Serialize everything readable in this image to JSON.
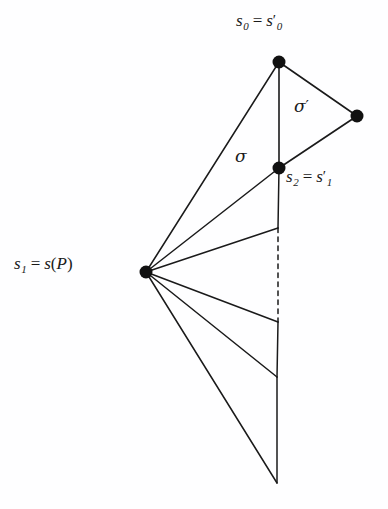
{
  "figure": {
    "name": "simplicial-fan-diagram",
    "background_color": "#fefeff",
    "stroke_color": "#1a1a1a",
    "width": 388,
    "height": 509
  },
  "labels": {
    "s0": {
      "base": "s",
      "sub": "0",
      "eq": "=",
      "base2": "s",
      "sub2": "0",
      "prime": "′",
      "text": "s0 = s0′"
    },
    "s1": {
      "base": "s",
      "sub": "1",
      "eq": "=",
      "fn": "s",
      "open": "(",
      "arg": "P",
      "close": ")",
      "text": "s1 = s(P)"
    },
    "s2": {
      "base": "s",
      "sub": "2",
      "eq": "=",
      "base2": "s",
      "sub2": "1",
      "prime": "′",
      "text": "s2 = s1′"
    },
    "sigma": {
      "glyph": "σ",
      "text": "σ"
    },
    "sigma_prime": {
      "glyph": "σ",
      "prime": "′",
      "text": "σ′"
    }
  },
  "vertices": [
    {
      "name": "s0",
      "x": 279,
      "y": 62,
      "radius": 6.5,
      "filled": true
    },
    {
      "name": "s0-prime-right",
      "x": 357,
      "y": 116,
      "radius": 6.5,
      "filled": true
    },
    {
      "name": "s2",
      "x": 279,
      "y": 168,
      "radius": 6.5,
      "filled": true
    },
    {
      "name": "s1",
      "x": 146,
      "y": 272,
      "radius": 6.5,
      "filled": true
    }
  ],
  "edges": [
    {
      "name": "edge-s0-to-right",
      "x1": 279,
      "y1": 62,
      "x2": 357,
      "y2": 116,
      "style": "solid"
    },
    {
      "name": "edge-right-to-s2",
      "x1": 357,
      "y1": 116,
      "x2": 279,
      "y2": 168,
      "style": "solid"
    },
    {
      "name": "edge-s0-to-s2-vertical",
      "x1": 279,
      "y1": 62,
      "x2": 279,
      "y2": 168,
      "style": "solid"
    },
    {
      "name": "edge-s2-to-midpoint-vertical",
      "x1": 279,
      "y1": 168,
      "x2": 278,
      "y2": 228,
      "style": "solid"
    },
    {
      "name": "edge-dashed-vertical",
      "x1": 278,
      "y1": 228,
      "x2": 278,
      "y2": 322,
      "style": "dashed"
    },
    {
      "name": "edge-lower-vertical-1",
      "x1": 278,
      "y1": 322,
      "x2": 277,
      "y2": 377,
      "style": "solid"
    },
    {
      "name": "edge-lower-vertical-2",
      "x1": 277,
      "y1": 377,
      "x2": 277,
      "y2": 483,
      "style": "solid"
    },
    {
      "name": "fan-edge-s1-to-s0",
      "x1": 146,
      "y1": 272,
      "x2": 279,
      "y2": 62,
      "style": "solid"
    },
    {
      "name": "fan-edge-s1-to-s2",
      "x1": 146,
      "y1": 272,
      "x2": 279,
      "y2": 168,
      "style": "solid"
    },
    {
      "name": "fan-edge-s1-to-p3",
      "x1": 146,
      "y1": 272,
      "x2": 278,
      "y2": 228,
      "style": "solid"
    },
    {
      "name": "fan-edge-s1-to-p4",
      "x1": 146,
      "y1": 272,
      "x2": 278,
      "y2": 322,
      "style": "solid"
    },
    {
      "name": "fan-edge-s1-to-p5",
      "x1": 146,
      "y1": 272,
      "x2": 277,
      "y2": 377,
      "style": "solid"
    },
    {
      "name": "fan-edge-s1-to-bottom",
      "x1": 146,
      "y1": 272,
      "x2": 277,
      "y2": 483,
      "style": "solid"
    }
  ]
}
